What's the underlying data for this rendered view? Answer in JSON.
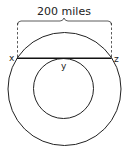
{
  "diagram": {
    "title_label": "200 miles",
    "points": {
      "left": "x",
      "middle": "y",
      "right": "z"
    },
    "colors": {
      "stroke": "#222222",
      "background": "#ffffff"
    }
  }
}
